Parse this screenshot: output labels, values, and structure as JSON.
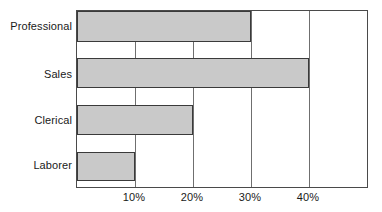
{
  "chart_data": {
    "type": "bar",
    "orientation": "horizontal",
    "title": "",
    "xlabel": "",
    "ylabel": "",
    "categories": [
      "Professional",
      "Sales",
      "Clerical",
      "Laborer"
    ],
    "values": [
      30,
      40,
      20,
      10
    ],
    "value_unit": "%",
    "xlim": [
      0,
      50
    ],
    "tick_labels": [
      "10%",
      "20%",
      "30%",
      "40%"
    ],
    "tick_values": [
      10,
      20,
      30,
      40
    ],
    "grid": "vertical-only",
    "legend": "none",
    "bar_fill_color": "#c9c9c9",
    "bar_border_color": "#3a3a3a",
    "axis_color": "#4a4a4a",
    "gridline_color": "#6f6f6f",
    "background_color": "#ffffff",
    "text_color": "#1a1a1a"
  }
}
